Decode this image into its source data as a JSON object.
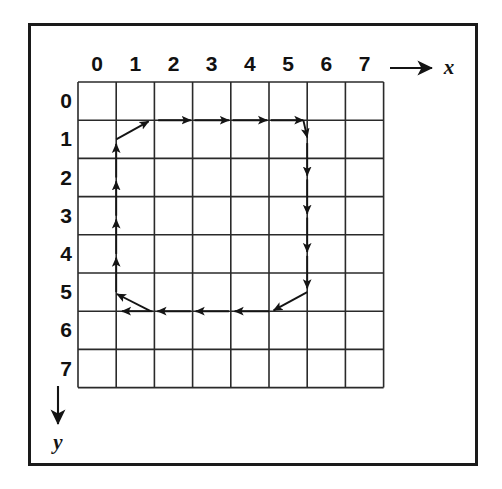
{
  "figure": {
    "kind": "grid-diagram",
    "background_color": "#ffffff",
    "ink_color": "#1a1a1a",
    "frame": {
      "name": "outer-border",
      "x": 28,
      "y": 23,
      "width": 450,
      "height": 443,
      "stroke_width": 3
    },
    "grid": {
      "origin_x": 78,
      "origin_y": 82,
      "cell": 38.2,
      "cols": 8,
      "rows": 8,
      "line_width": 1.6,
      "line_color": "#2a2a2a"
    },
    "axes": {
      "x": {
        "label": "x",
        "direction": "right",
        "arrow_x1": 390,
        "arrow_x2": 432,
        "arrow_y": 68,
        "label_x": 449,
        "label_y": 74
      },
      "y": {
        "label": "y",
        "direction": "down",
        "arrow_y1": 386,
        "arrow_y2": 424,
        "arrow_x": 58,
        "label_x": 58,
        "label_y": 449
      }
    },
    "col_labels": [
      "0",
      "1",
      "2",
      "3",
      "4",
      "5",
      "6",
      "7"
    ],
    "row_labels": [
      "0",
      "1",
      "2",
      "3",
      "4",
      "5",
      "6",
      "7"
    ],
    "path": {
      "closed": true,
      "orientation": "clockwise",
      "segment_count": 20,
      "segments": [
        {
          "name": "up-1",
          "type": "straight",
          "dir": "up",
          "gx": 1,
          "from_gy": 5.5,
          "to_gy": 4.6
        },
        {
          "name": "up-2",
          "type": "straight",
          "dir": "up",
          "gx": 1,
          "from_gy": 4.5,
          "to_gy": 3.6
        },
        {
          "name": "up-3",
          "type": "straight",
          "dir": "up",
          "gx": 1,
          "from_gy": 3.5,
          "to_gy": 2.6
        },
        {
          "name": "up-4",
          "type": "straight",
          "dir": "up",
          "gx": 1,
          "from_gy": 2.5,
          "to_gy": 1.62
        },
        {
          "name": "turn-tl",
          "type": "diagonal",
          "dir": "up-right",
          "from_gx": 1,
          "from_gy": 1.5,
          "to_gx": 1.85,
          "to_gy": 1.03
        },
        {
          "name": "right-1",
          "type": "straight",
          "dir": "right",
          "gy": 1,
          "from_gx": 2.1,
          "to_gx": 2.95
        },
        {
          "name": "right-2",
          "type": "straight",
          "dir": "right",
          "gy": 1,
          "from_gx": 3.05,
          "to_gx": 3.95
        },
        {
          "name": "right-3",
          "type": "straight",
          "dir": "right",
          "gy": 1,
          "from_gx": 4.05,
          "to_gx": 4.95
        },
        {
          "name": "right-4",
          "type": "straight",
          "dir": "right",
          "gy": 1,
          "from_gx": 5.05,
          "to_gx": 5.9
        },
        {
          "name": "turn-tr",
          "type": "diagonal",
          "dir": "down-right",
          "from_gx": 5.9,
          "from_gy": 1.0,
          "to_gx": 6.0,
          "to_gy": 1.45
        },
        {
          "name": "down-1",
          "type": "straight",
          "dir": "down",
          "gx": 6,
          "from_gy": 1.6,
          "to_gy": 2.45
        },
        {
          "name": "down-2",
          "type": "straight",
          "dir": "down",
          "gx": 6,
          "from_gy": 2.55,
          "to_gy": 3.45
        },
        {
          "name": "down-3",
          "type": "straight",
          "dir": "down",
          "gx": 6,
          "from_gy": 3.55,
          "to_gy": 4.45
        },
        {
          "name": "down-4",
          "type": "straight",
          "dir": "down",
          "gx": 6,
          "from_gy": 4.55,
          "to_gy": 5.4
        },
        {
          "name": "turn-br",
          "type": "diagonal",
          "dir": "down-left",
          "from_gx": 6.0,
          "from_gy": 5.5,
          "to_gx": 5.12,
          "to_gy": 5.98
        },
        {
          "name": "left-1",
          "type": "straight",
          "dir": "left",
          "gy": 6,
          "from_gx": 5.0,
          "to_gx": 4.1
        },
        {
          "name": "left-2",
          "type": "straight",
          "dir": "left",
          "gy": 6,
          "from_gx": 3.95,
          "to_gx": 3.08
        },
        {
          "name": "left-3",
          "type": "straight",
          "dir": "left",
          "gy": 6,
          "from_gx": 2.95,
          "to_gx": 2.08
        },
        {
          "name": "left-4",
          "type": "straight",
          "dir": "left",
          "gy": 6,
          "from_gx": 1.95,
          "to_gx": 1.15
        },
        {
          "name": "turn-bl",
          "type": "diagonal",
          "dir": "up-left",
          "from_gx": 1.9,
          "from_gy": 6.0,
          "to_gx": 1.02,
          "to_gy": 5.55
        }
      ]
    }
  }
}
